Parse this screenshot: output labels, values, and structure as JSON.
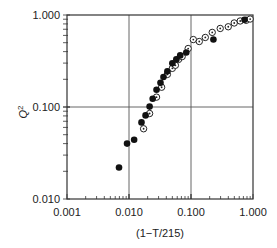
{
  "chart_data": {
    "type": "scatter",
    "title": "",
    "xlabel": "(1−T/215)",
    "ylabel": "Q²",
    "xscale": "log",
    "yscale": "log",
    "xlim": [
      0.001,
      1.0
    ],
    "ylim": [
      0.01,
      1.0
    ],
    "x_ticks": [
      "0.001",
      "0.010",
      "0.100",
      "1.000"
    ],
    "y_ticks": [
      "0.010",
      "0.100",
      "1.000"
    ],
    "grid": "major gridlines at 0.010 and 0.100 on x, 0.100 on y",
    "legend": null,
    "series": [
      {
        "name": "filled",
        "marker": "filled-circle",
        "points": [
          [
            0.0069,
            0.022
          ],
          [
            0.0093,
            0.04
          ],
          [
            0.0121,
            0.044
          ],
          [
            0.0159,
            0.068
          ],
          [
            0.0185,
            0.081
          ],
          [
            0.0215,
            0.101
          ],
          [
            0.0241,
            0.123
          ],
          [
            0.0278,
            0.154
          ],
          [
            0.0322,
            0.183
          ],
          [
            0.036,
            0.212
          ],
          [
            0.0416,
            0.244
          ],
          [
            0.05,
            0.298
          ],
          [
            0.058,
            0.329
          ],
          [
            0.067,
            0.364
          ],
          [
            0.084,
            0.391
          ],
          [
            0.23,
            0.542
          ],
          [
            0.73,
            0.889
          ]
        ]
      },
      {
        "name": "open",
        "marker": "open-circle-dot",
        "points": [
          [
            0.0172,
            0.058
          ],
          [
            0.0215,
            0.085
          ],
          [
            0.0278,
            0.128
          ],
          [
            0.0336,
            0.164
          ],
          [
            0.0416,
            0.226
          ],
          [
            0.05,
            0.263
          ],
          [
            0.056,
            0.284
          ],
          [
            0.063,
            0.329
          ],
          [
            0.072,
            0.353
          ],
          [
            0.09,
            0.432
          ],
          [
            0.109,
            0.541
          ],
          [
            0.136,
            0.515
          ],
          [
            0.17,
            0.57
          ],
          [
            0.22,
            0.647
          ],
          [
            0.296,
            0.714
          ],
          [
            0.399,
            0.745
          ],
          [
            0.498,
            0.819
          ],
          [
            0.622,
            0.861
          ],
          [
            0.776,
            0.876
          ],
          [
            0.9,
            0.904
          ]
        ]
      }
    ]
  },
  "axes": {
    "x_title": "(1−T/215)",
    "y_title": "Q",
    "y_title_sup": "2",
    "x_tick_labels": [
      "0.001",
      "0.010",
      "0.100",
      "1.000"
    ],
    "y_tick_labels": [
      "0.010",
      "0.100",
      "1.000"
    ]
  }
}
